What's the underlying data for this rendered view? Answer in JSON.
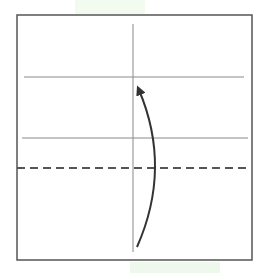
{
  "diagram": {
    "type": "origami-fold-step",
    "paper": {
      "x": 17,
      "y": 15,
      "width": 235,
      "height": 245,
      "border_color": "#555555"
    },
    "creases": {
      "vertical": {
        "x": 133,
        "y1": 24,
        "y2": 252,
        "color": "#888888"
      },
      "horizontal": [
        {
          "y": 77,
          "x1": 24,
          "x2": 244,
          "color": "#888888"
        },
        {
          "y": 138,
          "x1": 22,
          "x2": 248,
          "color": "#888888"
        }
      ]
    },
    "fold_line": {
      "style": "dashed",
      "y": 168,
      "x1": 17,
      "x2": 248,
      "color": "#555555"
    },
    "arrow": {
      "icon": "curved-arrow-up-icon",
      "path": "M137,247 Q172,168 139,88",
      "color": "#333333"
    },
    "caption": {
      "text": "",
      "note": "partially cut-off caption text at bottom edge"
    }
  }
}
